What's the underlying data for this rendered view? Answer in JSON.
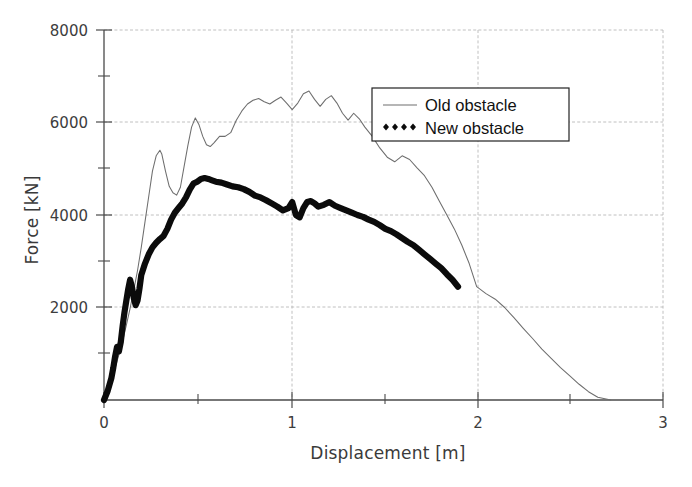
{
  "chart_data": {
    "type": "line",
    "title": "",
    "xlabel": "Displacement [m]",
    "ylabel": "Force [kN]",
    "xlim": [
      0,
      3
    ],
    "ylim": [
      0,
      8000
    ],
    "grid": true,
    "legend_position": "upper-right-inside",
    "x_ticks": [
      "0",
      "1",
      "2",
      "3"
    ],
    "x_tick_values": [
      0,
      1,
      2,
      3
    ],
    "x_minor_tick_values": [
      0.5,
      1.5,
      2.5
    ],
    "y_ticks": [
      "2000",
      "4000",
      "6000",
      "8000"
    ],
    "y_tick_values": [
      2000,
      4000,
      6000,
      8000
    ],
    "y_minor_tick_values": [
      1000,
      3000,
      5000,
      7000
    ],
    "series": [
      {
        "name": "Old obstacle",
        "style": "thin-line",
        "color": "#6e6e6e",
        "x": [
          0.0,
          0.02,
          0.04,
          0.06,
          0.08,
          0.1,
          0.12,
          0.14,
          0.16,
          0.18,
          0.2,
          0.22,
          0.24,
          0.26,
          0.28,
          0.3,
          0.31,
          0.33,
          0.35,
          0.37,
          0.39,
          0.41,
          0.43,
          0.45,
          0.47,
          0.49,
          0.51,
          0.53,
          0.55,
          0.57,
          0.59,
          0.62,
          0.65,
          0.68,
          0.71,
          0.74,
          0.77,
          0.8,
          0.83,
          0.86,
          0.89,
          0.92,
          0.95,
          0.98,
          1.01,
          1.04,
          1.07,
          1.1,
          1.13,
          1.16,
          1.19,
          1.22,
          1.25,
          1.28,
          1.31,
          1.34,
          1.37,
          1.4,
          1.44,
          1.48,
          1.52,
          1.56,
          1.6,
          1.64,
          1.68,
          1.72,
          1.76,
          1.8,
          1.84,
          1.88,
          1.92,
          1.96,
          2.0,
          2.05,
          2.1,
          2.15,
          2.2,
          2.25,
          2.3,
          2.35,
          2.4,
          2.45,
          2.5,
          2.55,
          2.6,
          2.65,
          2.72
        ],
        "y": [
          0,
          150,
          420,
          700,
          980,
          1280,
          1620,
          1980,
          2380,
          2800,
          3300,
          3850,
          4400,
          4950,
          5280,
          5400,
          5320,
          4950,
          4620,
          4480,
          4430,
          4600,
          5050,
          5500,
          5900,
          6100,
          5950,
          5700,
          5520,
          5480,
          5560,
          5700,
          5700,
          5780,
          6050,
          6250,
          6400,
          6480,
          6520,
          6450,
          6400,
          6480,
          6550,
          6420,
          6280,
          6420,
          6620,
          6680,
          6500,
          6350,
          6500,
          6580,
          6420,
          6200,
          6050,
          6200,
          6080,
          5900,
          5700,
          5450,
          5250,
          5150,
          5280,
          5200,
          5020,
          4850,
          4600,
          4300,
          4000,
          3700,
          3350,
          2950,
          2450,
          2300,
          2180,
          2000,
          1780,
          1550,
          1330,
          1100,
          900,
          700,
          520,
          340,
          180,
          60,
          0
        ]
      },
      {
        "name": "New obstacle",
        "style": "thick-dotted-line",
        "color": "#0b0b0b",
        "x": [
          0.0,
          0.02,
          0.04,
          0.05,
          0.06,
          0.07,
          0.08,
          0.09,
          0.1,
          0.11,
          0.12,
          0.13,
          0.14,
          0.15,
          0.16,
          0.17,
          0.18,
          0.19,
          0.2,
          0.22,
          0.24,
          0.26,
          0.28,
          0.3,
          0.32,
          0.34,
          0.36,
          0.38,
          0.4,
          0.42,
          0.44,
          0.46,
          0.48,
          0.5,
          0.52,
          0.54,
          0.56,
          0.58,
          0.6,
          0.63,
          0.66,
          0.69,
          0.72,
          0.75,
          0.78,
          0.81,
          0.84,
          0.87,
          0.9,
          0.93,
          0.96,
          0.99,
          1.01,
          1.03,
          1.05,
          1.07,
          1.09,
          1.11,
          1.13,
          1.15,
          1.18,
          1.21,
          1.24,
          1.27,
          1.3,
          1.33,
          1.36,
          1.39,
          1.42,
          1.45,
          1.48,
          1.51,
          1.54,
          1.57,
          1.6,
          1.63,
          1.66,
          1.69,
          1.72,
          1.75,
          1.78,
          1.81,
          1.84,
          1.87,
          1.9
        ],
        "y": [
          0,
          200,
          480,
          700,
          950,
          1150,
          1050,
          1250,
          1600,
          1900,
          2150,
          2400,
          2600,
          2450,
          2200,
          2050,
          2150,
          2400,
          2700,
          2950,
          3150,
          3300,
          3400,
          3480,
          3550,
          3700,
          3900,
          4050,
          4150,
          4250,
          4380,
          4550,
          4680,
          4720,
          4780,
          4800,
          4780,
          4750,
          4720,
          4700,
          4660,
          4620,
          4600,
          4560,
          4500,
          4420,
          4380,
          4320,
          4250,
          4180,
          4100,
          4150,
          4280,
          4000,
          3950,
          4150,
          4280,
          4300,
          4250,
          4180,
          4220,
          4280,
          4200,
          4150,
          4100,
          4050,
          4000,
          3960,
          3900,
          3850,
          3780,
          3700,
          3650,
          3580,
          3500,
          3420,
          3350,
          3250,
          3150,
          3050,
          2950,
          2850,
          2720,
          2600,
          2450
        ]
      }
    ],
    "legend": [
      {
        "label": "Old obstacle",
        "marker": "thin-line-swatch"
      },
      {
        "label": "New obstacle",
        "marker": "diamond-dotted-swatch"
      }
    ]
  },
  "caption": {
    "partial_text": ""
  }
}
